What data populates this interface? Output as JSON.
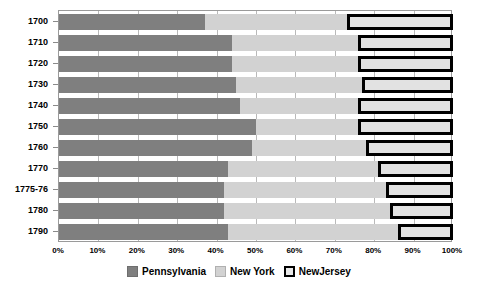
{
  "chart_data": {
    "type": "bar",
    "orientation": "horizontal",
    "stacked": true,
    "stack_mode": "percent",
    "title": "",
    "subtitle": "",
    "xlabel": "",
    "ylabel": "",
    "xlim": [
      0,
      100
    ],
    "grid": true,
    "legend_position": "bottom",
    "categories": [
      "1700",
      "1710",
      "1720",
      "1730",
      "1740",
      "1750",
      "1760",
      "1770",
      "1775-76",
      "1780",
      "1790"
    ],
    "xticks": [
      "0%",
      "10%",
      "20%",
      "30%",
      "40%",
      "50%",
      "60%",
      "70%",
      "80%",
      "90%",
      "100%"
    ],
    "xtick_values": [
      0,
      10,
      20,
      30,
      40,
      50,
      60,
      70,
      80,
      90,
      100
    ],
    "series": [
      {
        "name": "Pennsylvania",
        "color": "#7f7f7f",
        "values": [
          37,
          44,
          44,
          45,
          46,
          50,
          49,
          43,
          42,
          42,
          43
        ]
      },
      {
        "name": "New York",
        "color": "#d2d2d2",
        "values": [
          36,
          32,
          32,
          32,
          30,
          26,
          29,
          38,
          41,
          42,
          43
        ]
      },
      {
        "name": "NewJersey",
        "color": "#e2e2e2",
        "values": [
          27,
          24,
          24,
          23,
          24,
          24,
          22,
          19,
          17,
          16,
          14
        ]
      }
    ],
    "legend": [
      "Pennsylvania",
      "New York",
      "NewJersey"
    ],
    "colors": {
      "pennsylvania": "#7f7f7f",
      "new_york": "#d2d2d2",
      "new_jersey_fill": "#e2e2e2",
      "new_jersey_border": "#000000",
      "gridline": "#b9b9b9",
      "plot_border": "#9a9a9a",
      "background": "#ffffff",
      "text": "#000000"
    }
  }
}
